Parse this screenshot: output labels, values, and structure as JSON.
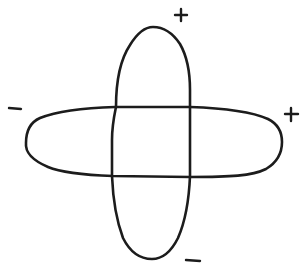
{
  "diagram": {
    "type": "crossed-orbital-sketch",
    "stroke_color": "#1c1c1c",
    "background": "#ffffff",
    "shapes": [
      {
        "name": "vertical-lobe-pair",
        "orientation": "vertical",
        "bbox": [
          112,
          27,
          190,
          259
        ]
      },
      {
        "name": "horizontal-lobe-pair",
        "orientation": "horizontal",
        "bbox": [
          25,
          106,
          282,
          178
        ]
      }
    ],
    "labels": [
      {
        "id": "top",
        "text": "+",
        "x": 181,
        "y": 14
      },
      {
        "id": "right",
        "text": "+",
        "x": 291,
        "y": 114
      },
      {
        "id": "left",
        "text": "−",
        "x": 12,
        "y": 108
      },
      {
        "id": "bottom",
        "text": "−",
        "x": 193,
        "y": 260
      }
    ]
  }
}
